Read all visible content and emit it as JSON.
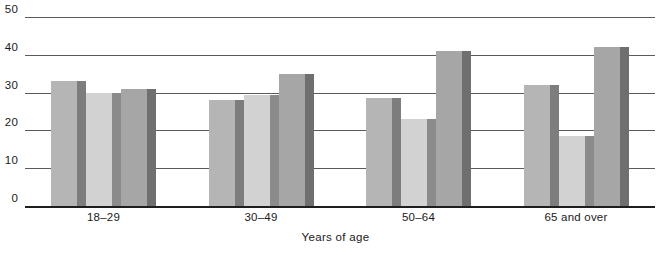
{
  "chart_data": {
    "type": "bar",
    "title": "",
    "subtitle": "",
    "xlabel": "Years of age",
    "ylabel": "",
    "categories": [
      "18–29",
      "30–49",
      "50–64",
      "65 and over"
    ],
    "series": [
      {
        "name": "series-1",
        "values": [
          33,
          28,
          28.5,
          32
        ],
        "color": "#b5b5b5",
        "side_color": "#7d7d7d"
      },
      {
        "name": "series-2",
        "values": [
          30,
          29.5,
          23,
          18.5
        ],
        "color": "#d2d2d2",
        "side_color": "#8b8b8b"
      },
      {
        "name": "series-3",
        "values": [
          31,
          35,
          41,
          42
        ],
        "color": "#a6a6a6",
        "side_color": "#6f6f6f"
      }
    ],
    "ylim": [
      0,
      50
    ],
    "yticks": [
      0,
      10,
      20,
      30,
      40,
      50
    ],
    "ytick_labels": [
      "0",
      "10",
      "20",
      "30",
      "40",
      "50"
    ],
    "grid": true,
    "grid_axis": "y",
    "legend": false,
    "legend_position": "none",
    "bar_style": "3d-extruded",
    "annotations": []
  },
  "axes": {
    "y_tick_labels": [
      "0",
      "10",
      "20",
      "30",
      "40",
      "50"
    ],
    "x_category_labels": [
      "18–29",
      "30–49",
      "50–64",
      "65 and over"
    ],
    "x_axis_title": "Years of age"
  },
  "colors": {
    "background": "#ffffff",
    "axis": "#1e1e1e",
    "gridline": "#3d3d3d",
    "text": "#1a1a1a"
  }
}
